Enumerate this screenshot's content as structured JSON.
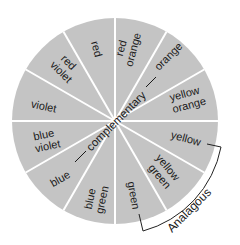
{
  "diagram": {
    "colors": {
      "wedge_fill": "#c4c4c4",
      "divider": "#ffffff",
      "text": "#1a1a1a",
      "bracket": "#222222"
    },
    "segments": [
      {
        "id": "red",
        "line1": "red",
        "line2": ""
      },
      {
        "id": "red-orange",
        "line1": "red",
        "line2": "orange"
      },
      {
        "id": "orange",
        "line1": "orange",
        "line2": ""
      },
      {
        "id": "yellow-orange",
        "line1": "yellow",
        "line2": "orange"
      },
      {
        "id": "yellow",
        "line1": "yellow",
        "line2": ""
      },
      {
        "id": "yellow-green",
        "line1": "yellow",
        "line2": "green"
      },
      {
        "id": "green",
        "line1": "green",
        "line2": ""
      },
      {
        "id": "blue-green",
        "line1": "blue",
        "line2": "green"
      },
      {
        "id": "blue",
        "line1": "blue",
        "line2": ""
      },
      {
        "id": "blue-violet",
        "line1": "blue",
        "line2": "violet"
      },
      {
        "id": "violet",
        "line1": "violet",
        "line2": ""
      },
      {
        "id": "red-violet",
        "line1": "red",
        "line2": "violet"
      }
    ],
    "complementary_label": "complementary",
    "analogous_label": "Analagous"
  }
}
